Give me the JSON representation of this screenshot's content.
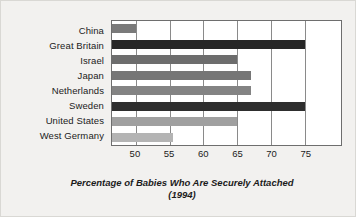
{
  "chart_data": {
    "type": "bar",
    "orientation": "horizontal",
    "title": "",
    "xlabel": "Percentage of Babies Who Are Securely Attached (1994)",
    "xlabel_lines": [
      "Percentage of Babies Who Are Securely Attached",
      "(1994)"
    ],
    "ylabel": "",
    "categories": [
      "China",
      "Great Britain",
      "Israel",
      "Japan",
      "Netherlands",
      "Sweden",
      "United States",
      "West Germany"
    ],
    "values": [
      50,
      75,
      65,
      67,
      67,
      75,
      65,
      55.5
    ],
    "bar_colors": [
      "#7a7a7a",
      "#262626",
      "#6d6d6d",
      "#767676",
      "#838383",
      "#2e2e2e",
      "#a0a0a0",
      "#b4b4b4"
    ],
    "xlim": [
      46.5,
      80.3
    ],
    "xticks": [
      50,
      55,
      60,
      65,
      70,
      75
    ],
    "xtick_labels": [
      "50",
      "55",
      "60",
      "65",
      "70",
      "75"
    ],
    "grid": true,
    "grid_axis": "x",
    "legend": null,
    "plot_background": "#ffffff",
    "figure_background": "#f2f1ef",
    "axis_color": "#6e6e6e"
  }
}
